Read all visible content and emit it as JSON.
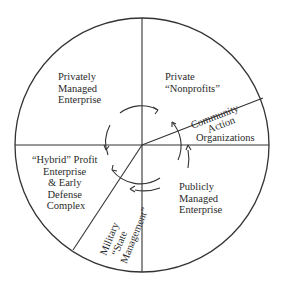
{
  "diagram": {
    "type": "sector-wheel",
    "stroke_color": "#333333",
    "background": "#ffffff",
    "sectors": [
      {
        "id": "privately-managed",
        "lines": [
          "Privately",
          "Managed",
          "Enterprise"
        ]
      },
      {
        "id": "private-nonprofits",
        "lines": [
          "Private",
          "“Nonprofits”"
        ]
      },
      {
        "id": "community-action",
        "lines": [
          "Community",
          "Action",
          "Organizations"
        ]
      },
      {
        "id": "publicly-managed",
        "lines": [
          "Publicly",
          "Managed",
          "Enterprise"
        ]
      },
      {
        "id": "military",
        "lines": [
          "Military",
          "“State",
          "Management”"
        ]
      },
      {
        "id": "hybrid-profit",
        "lines": [
          "“Hybrid” Profit",
          "Enterprise",
          "& Early",
          "Defense",
          "Complex"
        ]
      }
    ],
    "center_arrows": "circular flow arrows around the center"
  }
}
